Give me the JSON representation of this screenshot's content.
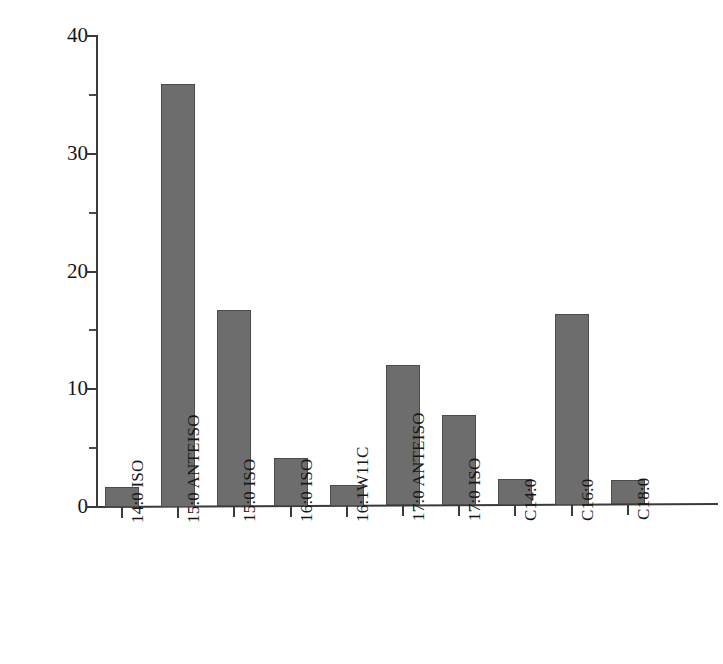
{
  "chart_data": {
    "type": "bar",
    "title": "",
    "xlabel": "",
    "ylabel": "脂肪酸含量/%",
    "ylim": [
      0,
      40
    ],
    "yticks": [
      0,
      10,
      20,
      30,
      40
    ],
    "ytick_labels": [
      "0",
      "10",
      "20",
      "30",
      "40"
    ],
    "grid": false,
    "legend": "none",
    "bar_color": "#6d6d6d",
    "axis_color": "#3a3a3a",
    "categories": [
      "14:0 ISO",
      "15:0 ANTEISO",
      "15:0 ISO",
      "16:0 ISO",
      "16:1W11C",
      "17:0 ANTEISO",
      "17:0 ISO",
      "C14:0",
      "C16:0",
      "C18:0"
    ],
    "values": [
      1.7,
      35.9,
      16.7,
      4.1,
      1.8,
      11.9,
      7.7,
      2.2,
      16.2,
      2.1
    ]
  }
}
